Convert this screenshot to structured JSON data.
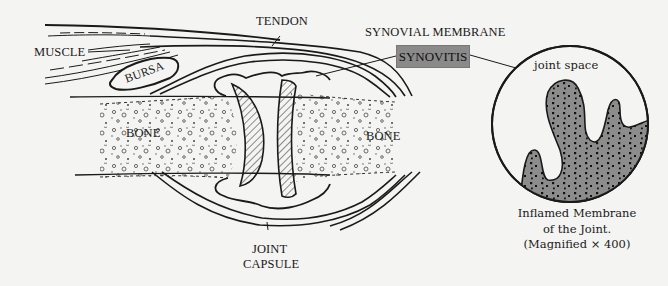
{
  "diagram": {
    "labels": {
      "muscle": "MUSCLE",
      "tendon": "TENDON",
      "bursa": "BURSA",
      "synovial_membrane": "SYNOVIAL MEMBRANE",
      "synovitis": "SYNOVITIS",
      "bone_left": "BONE",
      "bone_right": "BONE",
      "joint_capsule_line1": "JOINT",
      "joint_capsule_line2": "CAPSULE",
      "joint_space": "joint space"
    },
    "inset": {
      "caption_line1": "Inflamed Membrane",
      "caption_line2": "of the Joint.",
      "caption_line3": "(Magnified × 400)"
    },
    "colors": {
      "background": "#f4f4f2",
      "ink": "#1a1a1a",
      "synovitis_box": "#8a8a8a",
      "inflamed_tissue": "#8c8c8c"
    }
  }
}
